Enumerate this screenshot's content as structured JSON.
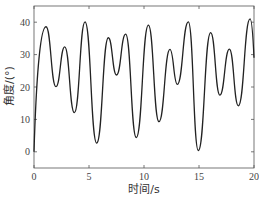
{
  "chart_data": {
    "type": "line",
    "title": "",
    "xlabel": "时间/s",
    "ylabel": "角度/(°)",
    "xlim": [
      0,
      20
    ],
    "ylim": [
      -5,
      45
    ],
    "xticks": [
      0,
      5,
      10,
      15,
      20
    ],
    "yticks": [
      0,
      10,
      20,
      30,
      40
    ],
    "grid": false,
    "legend": null,
    "series": [
      {
        "name": "angle",
        "color": "#222222",
        "x": [
          0,
          1.09,
          2.0,
          2.79,
          3.67,
          4.64,
          5.7,
          6.76,
          7.5,
          8.33,
          9.3,
          10.4,
          11.36,
          12.36,
          13.03,
          14.03,
          14.94,
          16.06,
          16.9,
          17.76,
          18.58,
          19.64,
          20.0
        ],
        "y": [
          0,
          38.6,
          20.1,
          32.4,
          12.1,
          40.1,
          2.7,
          35.2,
          23.7,
          36.3,
          4.4,
          39.1,
          9.3,
          31.6,
          20.8,
          40.1,
          0.4,
          36.8,
          17.5,
          31.7,
          14.2,
          41.0,
          29.0
        ]
      }
    ]
  },
  "axes": {
    "xlabel": "时间/s",
    "ylabel": "角度/(°)",
    "xtick_labels": [
      "0",
      "5",
      "10",
      "15",
      "20"
    ],
    "ytick_labels": [
      "0",
      "10",
      "20",
      "30",
      "40"
    ]
  }
}
